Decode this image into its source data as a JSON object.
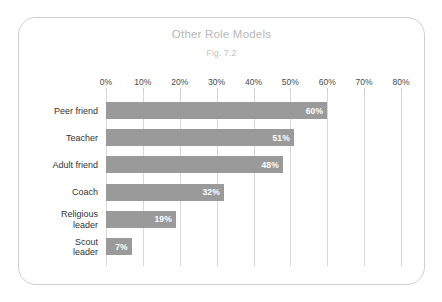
{
  "card": {
    "title": "Other Role Models",
    "subtitle": "Fig. 7.2"
  },
  "chart_data": {
    "type": "bar",
    "orientation": "horizontal",
    "title": "Other Role Models",
    "subtitle": "Fig. 7.2",
    "xlabel": "",
    "ylabel": "",
    "xlim": [
      0,
      80
    ],
    "xtick_step": 10,
    "xticks": [
      "0%",
      "10%",
      "20%",
      "30%",
      "40%",
      "50%",
      "60%",
      "70%",
      "80%"
    ],
    "xtick_values": [
      0,
      10,
      20,
      30,
      40,
      50,
      60,
      70,
      80
    ],
    "grid": true,
    "legend": false,
    "bar_color": "#9a9a9a",
    "value_label_color": "#ffffff",
    "categories": [
      "Peer friend",
      "Teacher",
      "Adult friend",
      "Coach",
      "Religious leader",
      "Scout leader"
    ],
    "values": [
      60,
      51,
      48,
      32,
      19,
      7
    ],
    "value_labels": [
      "60%",
      "51%",
      "48%",
      "32%",
      "19%",
      "7%"
    ],
    "bars": [
      {
        "category_lines": [
          "Peer friend"
        ],
        "value": 60,
        "label": "60%"
      },
      {
        "category_lines": [
          "Teacher"
        ],
        "value": 51,
        "label": "51%"
      },
      {
        "category_lines": [
          "Adult friend"
        ],
        "value": 48,
        "label": "48%"
      },
      {
        "category_lines": [
          "Coach"
        ],
        "value": 32,
        "label": "32%"
      },
      {
        "category_lines": [
          "Religious",
          "leader"
        ],
        "value": 19,
        "label": "19%"
      },
      {
        "category_lines": [
          "Scout",
          "leader"
        ],
        "value": 7,
        "label": "7%"
      }
    ]
  }
}
